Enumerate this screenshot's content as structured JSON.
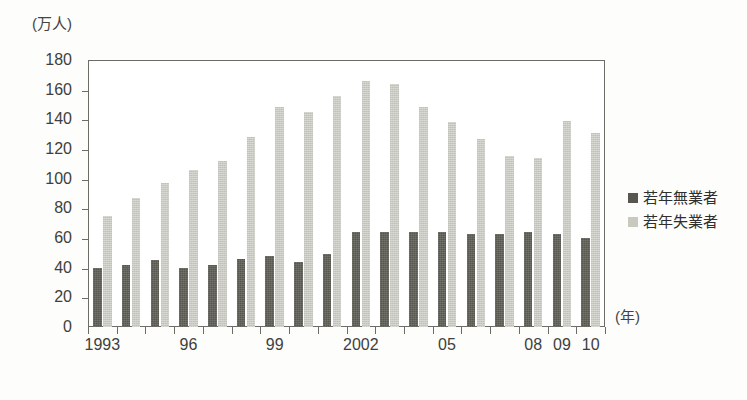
{
  "chart_data": {
    "type": "bar",
    "title": "",
    "subtitle": "",
    "ylabel": "(万人)",
    "xlabel": "(年)",
    "ylim": [
      0,
      180
    ],
    "ytick_values": [
      0,
      20,
      40,
      60,
      80,
      100,
      120,
      140,
      160,
      180
    ],
    "ytick_labels": [
      "0",
      "20",
      "40",
      "60",
      "80",
      "100",
      "120",
      "140",
      "160",
      "180"
    ],
    "grid": false,
    "legend_position": "right",
    "categories": [
      "1993",
      "1994",
      "1995",
      "1996",
      "1997",
      "1998",
      "1999",
      "2000",
      "2001",
      "2002",
      "2003",
      "2004",
      "2005",
      "2006",
      "2007",
      "2008",
      "2009",
      "2010"
    ],
    "xtick_labels": [
      "1993",
      "",
      "",
      "96",
      "",
      "",
      "99",
      "",
      "",
      "2002",
      "",
      "",
      "05",
      "",
      "",
      "08",
      "09",
      "10"
    ],
    "series": [
      {
        "name": "若年無業者",
        "color": "#57574f",
        "values": [
          40,
          42,
          45,
          40,
          42,
          46,
          48,
          44,
          49,
          64,
          64,
          64,
          64,
          63,
          63,
          64,
          63,
          60
        ]
      },
      {
        "name": "若年失業者",
        "color": "#c9c9c0",
        "values": [
          75,
          87,
          97,
          106,
          112,
          128,
          148,
          145,
          156,
          166,
          164,
          148,
          138,
          127,
          115,
          114,
          139,
          131
        ]
      }
    ]
  },
  "legend": {
    "items": [
      {
        "label": "若年無業者",
        "swatch": "dark"
      },
      {
        "label": "若年失業者",
        "swatch": "light"
      }
    ]
  },
  "axes": {
    "y_unit_caption": "(万人)",
    "x_unit_caption": "(年)"
  }
}
